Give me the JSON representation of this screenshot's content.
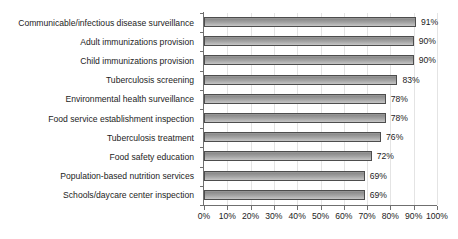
{
  "chart_data": {
    "type": "bar",
    "orientation": "horizontal",
    "title": "",
    "subtitle": "",
    "xlabel": "",
    "ylabel": "",
    "xlim": [
      0,
      100
    ],
    "grid": true,
    "legend": false,
    "legend_position": "none",
    "categories": [
      "Communicable/infectious disease surveillance",
      "Adult immunizations provision",
      "Child immunizations provision",
      "Tuberculosis screening",
      "Environmental health surveillance",
      "Food service establishment inspection",
      "Tuberculosis treatment",
      "Food safety education",
      "Population-based nutrition services",
      "Schools/daycare center inspection"
    ],
    "values": [
      91,
      90,
      90,
      83,
      78,
      78,
      76,
      72,
      69,
      69
    ],
    "value_labels": [
      "91%",
      "90%",
      "90%",
      "83%",
      "78%",
      "78%",
      "76%",
      "72%",
      "69%",
      "69%"
    ],
    "xticks": [
      0,
      10,
      20,
      30,
      40,
      50,
      60,
      70,
      80,
      90,
      100
    ],
    "xticklabels": [
      "0%",
      "10%",
      "20%",
      "30%",
      "40%",
      "50%",
      "60%",
      "70%",
      "80%",
      "90%",
      "100%"
    ],
    "colors": {
      "bar_fill_top": "#8d8d8d",
      "bar_fill_bottom": "#c6c6c6",
      "bar_border": "#4d4d4d",
      "gridline": "#e4e4e4",
      "axis": "#6f6f6f",
      "text": "#1c1c1c",
      "background": "#ffffff"
    }
  }
}
